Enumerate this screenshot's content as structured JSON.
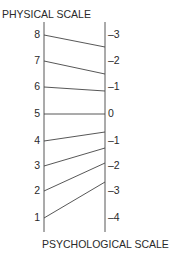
{
  "diagram": {
    "top_title": "PHYSICAL SCALE",
    "bottom_title": "PSYCHOLOGICAL SCALE",
    "line_color": "#444444",
    "left_axis": {
      "x": 44,
      "y_top": 22,
      "y_bottom": 232
    },
    "right_axis": {
      "x": 105,
      "y_top": 22,
      "y_bottom": 232
    },
    "mappings": [
      {
        "physical": "8",
        "psychological": "–3",
        "left_y": 35,
        "right_y": 47,
        "label_right_y": 35
      },
      {
        "physical": "7",
        "psychological": "–2",
        "left_y": 61,
        "right_y": 74,
        "label_right_y": 61
      },
      {
        "physical": "6",
        "psychological": "–1",
        "left_y": 87,
        "right_y": 91,
        "label_right_y": 87
      },
      {
        "physical": "5",
        "psychological": "0",
        "left_y": 114,
        "right_y": 114,
        "label_right_y": 114
      },
      {
        "physical": "4",
        "psychological": "–1",
        "left_y": 141,
        "right_y": 132,
        "label_right_y": 141
      },
      {
        "physical": "3",
        "psychological": "–2",
        "left_y": 166,
        "right_y": 148,
        "label_right_y": 166
      },
      {
        "physical": "2",
        "psychological": "–3",
        "left_y": 191,
        "right_y": 163,
        "label_right_y": 191
      },
      {
        "physical": "1",
        "psychological": "–4",
        "left_y": 218,
        "right_y": 182,
        "label_right_y": 218
      }
    ]
  }
}
